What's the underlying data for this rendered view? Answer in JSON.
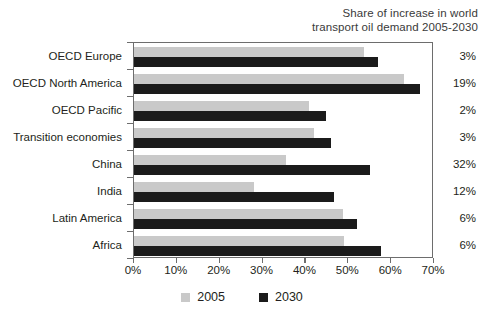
{
  "note": {
    "line1": "Share of increase in world",
    "line2": "transport oil demand 2005-2030"
  },
  "legend": {
    "items": [
      {
        "label": "2005",
        "color": "#c9c9c9",
        "swatch_name": "legend-swatch-2005"
      },
      {
        "label": "2030",
        "color": "#1b1b1b",
        "swatch_name": "legend-swatch-2030"
      }
    ]
  },
  "share_column": {
    "values": [
      "3%",
      "19%",
      "2%",
      "3%",
      "32%",
      "12%",
      "6%",
      "6%"
    ]
  },
  "axis": {
    "tick_labels": [
      "0%",
      "10%",
      "20%",
      "30%",
      "40%",
      "50%",
      "60%",
      "70%"
    ],
    "tick_values": [
      0,
      10,
      20,
      30,
      40,
      50,
      60,
      70
    ]
  },
  "chart_data": {
    "type": "bar",
    "orientation": "horizontal",
    "title": "",
    "subtitle": "",
    "annotation": "Share of increase in world transport oil demand 2005-2030",
    "xlabel": "",
    "ylabel": "",
    "xlim": [
      0,
      70
    ],
    "xticks": [
      0,
      10,
      20,
      30,
      40,
      50,
      60,
      70
    ],
    "xtick_labels": [
      "0%",
      "10%",
      "20%",
      "30%",
      "40%",
      "50%",
      "60%",
      "70%"
    ],
    "grid": false,
    "legend_position": "bottom-center",
    "categories": [
      "OECD Europe",
      "OECD North America",
      "OECD Pacific",
      "Transition economies",
      "China",
      "India",
      "Latin America",
      "Africa"
    ],
    "series": [
      {
        "name": "2005",
        "color": "#c9c9c9",
        "values": [
          53.7,
          63.0,
          40.8,
          42.0,
          35.4,
          28.0,
          48.7,
          49.0
        ]
      },
      {
        "name": "2030",
        "color": "#1b1b1b",
        "values": [
          57.0,
          66.7,
          44.8,
          46.0,
          55.0,
          46.7,
          52.0,
          57.6
        ]
      }
    ],
    "side_column": {
      "header": "Share of increase in world transport oil demand 2005-2030",
      "values": [
        "3%",
        "19%",
        "2%",
        "3%",
        "32%",
        "12%",
        "6%",
        "6%"
      ]
    }
  }
}
